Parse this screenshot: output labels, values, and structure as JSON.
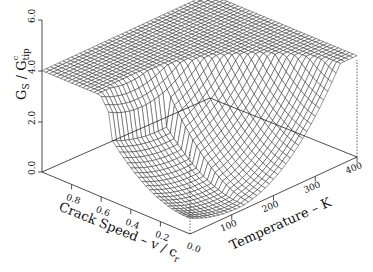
{
  "chart_data": {
    "type": "surface3d",
    "title": "",
    "zlabel": "G_S / G_tip^c",
    "zlabel_parts": {
      "main": "G",
      "sub1": "S",
      "slash": " / ",
      "main2": "G",
      "sub2": "tip",
      "sup2": "c"
    },
    "xlabel": "Crack Speed - v / c_r",
    "xlabel_parts": {
      "text": "Crack Speed – v / c",
      "sub": "r"
    },
    "ylabel": "Temperature - K",
    "ylabel_text": "Temperature – K",
    "x_axis": {
      "name": "crack_speed",
      "range": [
        0.0,
        1.0
      ],
      "ticks": [
        0.2,
        0.4,
        0.6,
        0.8
      ],
      "tick_labels": [
        "0.2",
        "0.4",
        "0.6",
        "0.8"
      ],
      "origin_label": "0.0"
    },
    "y_axis": {
      "name": "temperature",
      "range": [
        0,
        400
      ],
      "ticks": [
        100,
        200,
        300,
        400
      ],
      "tick_labels": [
        "100",
        "200",
        "300",
        "400"
      ]
    },
    "z_axis": {
      "range": [
        0.0,
        6.0
      ],
      "ticks": [
        0.0,
        2.0,
        4.0,
        6.0
      ],
      "tick_labels": [
        "0.0",
        "2.0",
        "4.0",
        "6.0"
      ]
    },
    "surface_description": "Surface clipped at z=4.0 plateau; bowl-shaped minimum near low crack speed and low-to-mid temperature, dropping toward 0 near v/c_r≈0, T≈0-200 K.",
    "grid": {
      "nx": 40,
      "ny": 40
    },
    "cap": 4.0,
    "grid_on": false,
    "legend": null
  },
  "axes": {
    "z_ticks": [
      "0.0",
      "2.0",
      "4.0",
      "6.0"
    ],
    "x_ticks": [
      "0.8",
      "0.6",
      "0.4",
      "0.2",
      "0.0"
    ],
    "y_ticks": [
      "100",
      "200",
      "300",
      "400"
    ]
  }
}
